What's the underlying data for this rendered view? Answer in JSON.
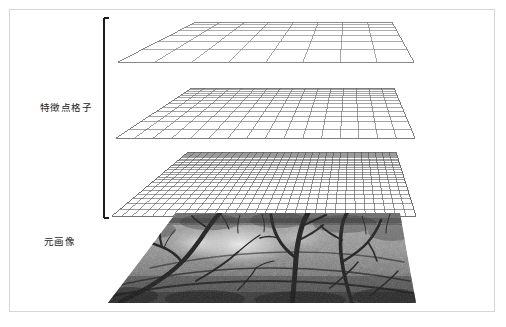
{
  "figure": {
    "background_color": "#ffffff",
    "frame_color": "#d6d6d6",
    "width": 506,
    "height": 327
  },
  "labels": {
    "feature_grid": "特徴点格子",
    "original_image": "元画像"
  },
  "bracket": {
    "name": "feature-grid-bracket",
    "color": "#1c1c1c",
    "x": 104,
    "y_top": 18,
    "y_bottom": 218,
    "serif_length": 5
  },
  "layers": [
    {
      "id": "grid-coarse",
      "name": "feature-point-grid-coarse",
      "columns": 8,
      "rows": 7,
      "line_color": "#6b6b6b",
      "top_y": 22,
      "bottom_y": 62,
      "top_left_x": 196,
      "top_right_x": 392,
      "bottom_left_x": 118,
      "bottom_right_x": 414
    },
    {
      "id": "grid-medium",
      "name": "feature-point-grid-medium",
      "columns": 16,
      "rows": 13,
      "line_color": "#5e5e5e",
      "top_y": 88,
      "bottom_y": 138,
      "top_left_x": 192,
      "top_right_x": 394,
      "bottom_left_x": 116,
      "bottom_right_x": 415
    },
    {
      "id": "grid-fine",
      "name": "feature-point-grid-fine",
      "columns": 30,
      "rows": 24,
      "line_color": "#4f4f4f",
      "top_y": 152,
      "bottom_y": 216,
      "top_left_x": 188,
      "top_right_x": 396,
      "bottom_left_x": 112,
      "bottom_right_x": 416
    }
  ],
  "photo": {
    "id": "original-image-plane",
    "name": "original-photograph",
    "description": "grayscale photograph of bare tree branches over ground",
    "top_y": 213,
    "bottom_y": 303,
    "top_left_x": 176,
    "top_right_x": 400,
    "bottom_left_x": 108,
    "bottom_right_x": 416,
    "tone_dark": "#2a2a2a",
    "tone_mid": "#8a8a8a",
    "tone_light": "#e8e8e8"
  },
  "chart_data": {
    "type": "diagram",
    "title": "",
    "annotations": [
      "特徴点格子",
      "元画像"
    ],
    "layer_resolutions": [
      8,
      16,
      30
    ],
    "layer_names": [
      "coarse",
      "medium",
      "fine"
    ]
  }
}
